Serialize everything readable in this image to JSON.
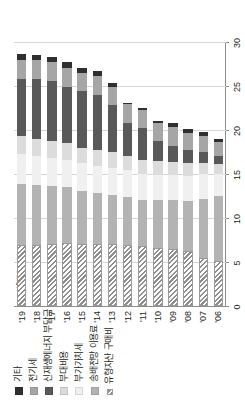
{
  "chart_data": {
    "type": "bar",
    "orientation": "horizontal",
    "stacked": true,
    "title": "",
    "subtitle": "",
    "xlabel": "(센트/kWh)",
    "ylabel": "",
    "unit": "센트/kWh",
    "xlim": [
      0,
      30
    ],
    "xticks": [
      0,
      5,
      10,
      15,
      20,
      25,
      30
    ],
    "xticklabels": [
      "0",
      "5",
      "10",
      "15",
      "20",
      "25",
      "30"
    ],
    "grid": true,
    "legend_position": "top-left",
    "categories": [
      "'06",
      "'07",
      "'08",
      "'09",
      "'10",
      "'11",
      "'12",
      "'13",
      "'14",
      "'15",
      "'16",
      "'17",
      "'18",
      "'19"
    ],
    "series": [
      {
        "name": "유형자산 구매비",
        "color": "#8e8e8e",
        "pattern": "diagonal-hatch",
        "values": [
          5.1,
          5.5,
          6.3,
          6.5,
          6.6,
          6.8,
          6.9,
          7.0,
          7.0,
          7.1,
          7.2,
          7.0,
          6.9,
          6.9
        ]
      },
      {
        "name": "송배전망 이용료",
        "color": "#b3b3b3",
        "values": [
          7.4,
          6.7,
          5.6,
          5.5,
          5.4,
          5.3,
          5.5,
          5.6,
          5.8,
          6.0,
          6.3,
          6.6,
          6.8,
          7.0
        ]
      },
      {
        "name": "부가가치세",
        "color": "#f0f0f0",
        "values": [
          2.5,
          2.8,
          2.9,
          2.9,
          2.9,
          2.9,
          3.0,
          3.1,
          3.1,
          3.1,
          3.1,
          3.2,
          3.3,
          3.4
        ]
      },
      {
        "name": "부대비용",
        "color": "#dcdcdc",
        "values": [
          1.1,
          1.3,
          1.4,
          1.5,
          1.6,
          1.6,
          1.7,
          1.8,
          1.8,
          1.8,
          1.9,
          1.9,
          2.0,
          2.0
        ]
      },
      {
        "name": "신재생에너지 부담금",
        "color": "#595959",
        "values": [
          0.9,
          1.2,
          1.5,
          1.8,
          2.2,
          3.6,
          3.7,
          5.3,
          6.3,
          6.4,
          6.4,
          6.9,
          6.8,
          6.5
        ]
      },
      {
        "name": "전기세",
        "color": "#a6a6a6",
        "values": [
          1.6,
          1.8,
          2.0,
          2.1,
          2.1,
          2.1,
          2.1,
          2.1,
          2.1,
          2.1,
          2.1,
          2.1,
          2.1,
          2.1
        ]
      },
      {
        "name": "기타",
        "color": "#2f2f2f",
        "values": [
          0.4,
          0.5,
          0.4,
          0.5,
          0.2,
          0.2,
          0.2,
          0.4,
          0.6,
          0.6,
          0.7,
          0.6,
          0.6,
          0.7
        ]
      }
    ],
    "legend": [
      {
        "label": "기타",
        "color": "#2f2f2f"
      },
      {
        "label": "전기세",
        "color": "#a6a6a6"
      },
      {
        "label": "신재생에너지 부담금",
        "color": "#595959"
      },
      {
        "label": "부대비용",
        "color": "#dcdcdc"
      },
      {
        "label": "부가가치세",
        "color": "#f0f0f0"
      },
      {
        "label": "송배전망 이용료",
        "color": "#b3b3b3"
      },
      {
        "label": "유형자산 구매비",
        "color": "#8e8e8e"
      }
    ]
  }
}
